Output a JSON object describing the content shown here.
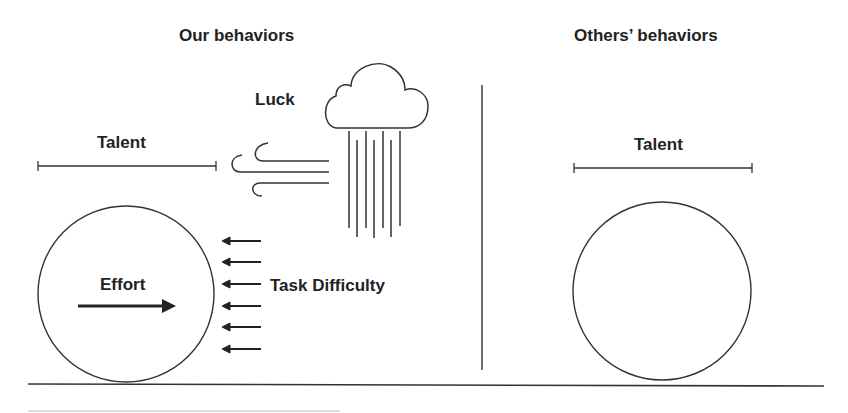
{
  "diagram": {
    "left_panel": {
      "title": "Our behaviors",
      "talent_label": "Talent",
      "luck_label": "Luck",
      "effort_label": "Effort",
      "task_difficulty_label": "Task Difficulty"
    },
    "right_panel": {
      "title": "Others’ behaviors",
      "talent_label": "Talent"
    },
    "icons": [
      "cloud-icon",
      "rain-icon",
      "wind-icon",
      "effort-arrow-icon",
      "difficulty-arrow-icon"
    ],
    "colors": {
      "line": "#333333",
      "text": "#222222",
      "background": "#ffffff"
    }
  }
}
